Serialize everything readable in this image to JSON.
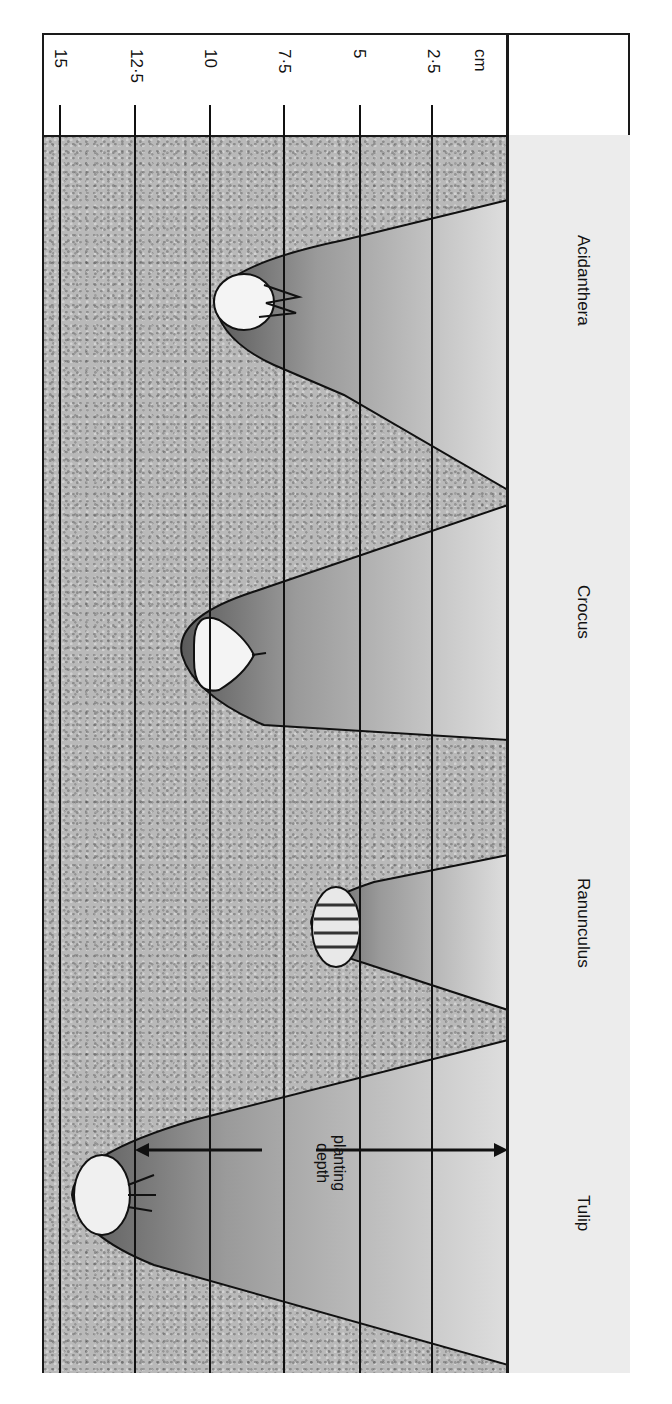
{
  "diagram": {
    "orientation": "rotated 90 degrees clockwise",
    "units_label": "cm",
    "depth_scale": [
      {
        "value": "2·5",
        "cm": 2.5
      },
      {
        "value": "5",
        "cm": 5
      },
      {
        "value": "7·5",
        "cm": 7.5
      },
      {
        "value": "10",
        "cm": 10
      },
      {
        "value": "12·5",
        "cm": 12.5
      },
      {
        "value": "15",
        "cm": 15
      }
    ],
    "plants": [
      {
        "name": "Acidanthera",
        "approx_depth_cm": 10
      },
      {
        "name": "Crocus",
        "approx_depth_cm": 10
      },
      {
        "name": "Ranunculus",
        "approx_depth_cm": 5
      },
      {
        "name": "Tulip",
        "approx_depth_cm": 12.5
      }
    ],
    "annotation": {
      "line1": "planting",
      "line2": "depth"
    },
    "colors": {
      "soil": "#b9b9b9",
      "hole": "#d8d8d8",
      "surface_strip": "#ececec",
      "lines": "#111111"
    }
  }
}
